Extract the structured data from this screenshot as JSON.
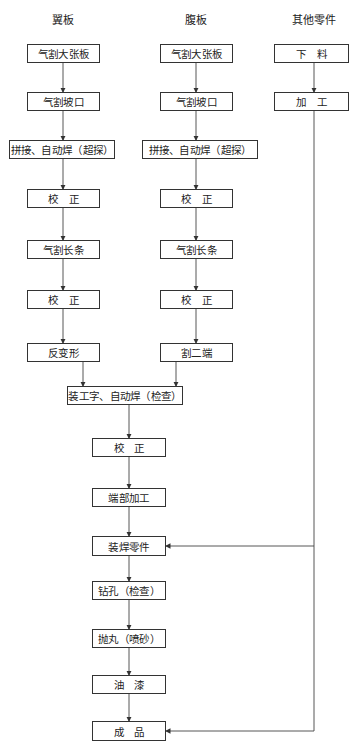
{
  "columns": {
    "flange": {
      "title": "翼板",
      "steps": [
        "气割大张板",
        "气割坡口",
        "拼接、自动焊（超探）",
        "校　正",
        "气割长条",
        "校　正",
        "反变形"
      ]
    },
    "web": {
      "title": "腹板",
      "steps": [
        "气割大张板",
        "气割坡口",
        "拼接、自动焊（超探）",
        "校　正",
        "气割长条",
        "校　正",
        "割二端"
      ]
    },
    "parts": {
      "title": "其他零件",
      "steps": [
        "下　料",
        "加　工"
      ]
    }
  },
  "main_flow": {
    "steps": [
      "装工字、自动焊（检查）",
      "校　正",
      "端部加工",
      "装焊零件",
      "钻孔（检查）",
      "抛丸（喷砂）",
      "油　漆",
      "成　品"
    ]
  },
  "connections": [
    {
      "from": "flange.6",
      "to": "main_flow.0"
    },
    {
      "from": "web.6",
      "to": "main_flow.0"
    },
    {
      "from": "parts.1",
      "to": "main_flow.3"
    },
    {
      "from": "parts.1",
      "to": "main_flow.7"
    }
  ],
  "colors": {
    "line": "#333333",
    "box_border": "#333333",
    "background": "#ffffff"
  }
}
